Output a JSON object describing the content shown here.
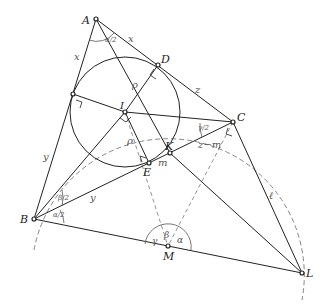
{
  "diagram": {
    "type": "geometry",
    "points": {
      "A": {
        "label": "A",
        "x": 96,
        "y": 19
      },
      "D": {
        "label": "D",
        "x": 158,
        "y": 65
      },
      "C": {
        "label": "C",
        "x": 233,
        "y": 122
      },
      "I": {
        "label": "I",
        "x": 125,
        "y": 112
      },
      "F": {
        "label": "",
        "x": 73,
        "y": 94
      },
      "E": {
        "label": "E",
        "x": 149,
        "y": 163
      },
      "K": {
        "label": "K",
        "x": 170,
        "y": 153
      },
      "B": {
        "label": "B",
        "x": 34,
        "y": 219
      },
      "M": {
        "label": "M",
        "x": 168,
        "y": 246
      },
      "L": {
        "label": "L",
        "x": 302,
        "y": 273
      }
    },
    "segment_labels": {
      "AD": "x",
      "AF": "x",
      "ID": "ρ",
      "IE": "ρ",
      "DC": "z",
      "BF": "y",
      "BE": "y",
      "EK": "m",
      "KC": "z−m",
      "CL": "ℓ"
    },
    "angle_labels": {
      "A_half": "α/2",
      "B_half_top": "β/2",
      "B_half_bottom": "α/2",
      "C_half": "γ/2",
      "M_gamma": "γ",
      "M_beta": "β",
      "M_alpha": "α"
    },
    "colors": {
      "line": "#222222",
      "dashed": "#777777",
      "point_fill": "#ffffff"
    }
  }
}
